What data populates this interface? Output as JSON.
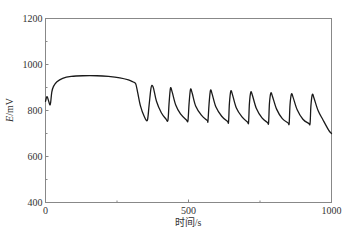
{
  "chart_data": {
    "type": "line",
    "title": "",
    "xlabel": "时间/s",
    "ylabel_italic": "E",
    "ylabel_rest": "/mV",
    "ylabel": "E/mV",
    "xlim": [
      0,
      1000
    ],
    "ylim": [
      400,
      1200
    ],
    "x_ticks": [
      0,
      500,
      1000
    ],
    "x_tick_labels": [
      "0",
      "500",
      "1000"
    ],
    "x_minor_ticks": [
      250,
      750
    ],
    "y_ticks": [
      400,
      600,
      800,
      1000,
      1200
    ],
    "y_tick_labels": [
      "400",
      "600",
      "800",
      "1000",
      "1200"
    ],
    "y_minor_ticks": [
      500,
      700,
      900,
      1100
    ],
    "grid": false,
    "legend": null,
    "series": [
      {
        "name": "E",
        "color": "#1a1a1a",
        "points": [
          [
            0,
            840
          ],
          [
            5,
            860
          ],
          [
            10,
            845
          ],
          [
            15,
            825
          ],
          [
            18,
            835
          ],
          [
            22,
            880
          ],
          [
            28,
            905
          ],
          [
            40,
            925
          ],
          [
            60,
            940
          ],
          [
            90,
            948
          ],
          [
            130,
            951
          ],
          [
            180,
            951
          ],
          [
            220,
            948
          ],
          [
            260,
            942
          ],
          [
            290,
            933
          ],
          [
            305,
            925
          ],
          [
            315,
            917
          ],
          [
            322,
            880
          ],
          [
            332,
            820
          ],
          [
            345,
            775
          ],
          [
            356,
            757
          ],
          [
            362,
            820
          ],
          [
            368,
            890
          ],
          [
            372,
            909
          ],
          [
            378,
            895
          ],
          [
            388,
            840
          ],
          [
            405,
            790
          ],
          [
            420,
            765
          ],
          [
            428,
            757
          ],
          [
            432,
            830
          ],
          [
            437,
            897
          ],
          [
            443,
            880
          ],
          [
            455,
            825
          ],
          [
            472,
            785
          ],
          [
            492,
            760
          ],
          [
            498,
            755
          ],
          [
            502,
            830
          ],
          [
            507,
            892
          ],
          [
            513,
            875
          ],
          [
            525,
            820
          ],
          [
            545,
            780
          ],
          [
            565,
            757
          ],
          [
            568,
            754
          ],
          [
            572,
            830
          ],
          [
            577,
            888
          ],
          [
            583,
            870
          ],
          [
            596,
            815
          ],
          [
            616,
            775
          ],
          [
            636,
            753
          ],
          [
            640,
            750
          ],
          [
            643,
            830
          ],
          [
            648,
            885
          ],
          [
            654,
            868
          ],
          [
            667,
            812
          ],
          [
            687,
            772
          ],
          [
            706,
            750
          ],
          [
            710,
            748
          ],
          [
            713,
            830
          ],
          [
            718,
            880
          ],
          [
            724,
            864
          ],
          [
            737,
            810
          ],
          [
            757,
            768
          ],
          [
            776,
            748
          ],
          [
            780,
            746
          ],
          [
            783,
            830
          ],
          [
            788,
            876
          ],
          [
            794,
            860
          ],
          [
            808,
            806
          ],
          [
            828,
            765
          ],
          [
            848,
            746
          ],
          [
            852,
            744
          ],
          [
            855,
            825
          ],
          [
            860,
            872
          ],
          [
            866,
            856
          ],
          [
            880,
            803
          ],
          [
            900,
            762
          ],
          [
            920,
            744
          ],
          [
            925,
            743
          ],
          [
            928,
            820
          ],
          [
            933,
            870
          ],
          [
            939,
            853
          ],
          [
            953,
            800
          ],
          [
            970,
            760
          ],
          [
            990,
            715
          ],
          [
            1000,
            700
          ]
        ]
      }
    ]
  }
}
